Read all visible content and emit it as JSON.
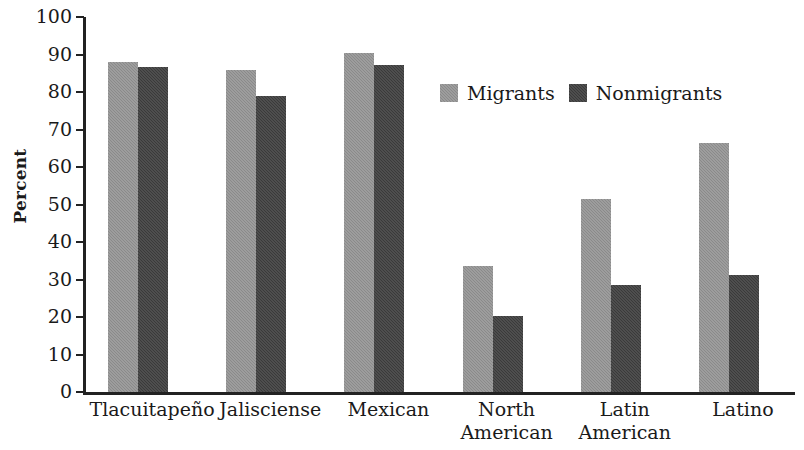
{
  "chart_data": {
    "type": "bar",
    "title": "",
    "xlabel": "",
    "ylabel": "Percent",
    "ylim": [
      0,
      100
    ],
    "ytick_step": 10,
    "yticks": [
      100,
      90,
      80,
      70,
      60,
      50,
      40,
      30,
      20,
      10,
      0
    ],
    "grid": false,
    "legend_position": "upper center",
    "categories": [
      "Tlacuitapeño",
      "Jalisciense",
      "Mexican",
      "North American",
      "Latin American",
      "Latino"
    ],
    "category_lines": [
      [
        "Tlacuitapeño"
      ],
      [
        "Jalisciense"
      ],
      [
        "Mexican"
      ],
      [
        "North",
        "American"
      ],
      [
        "Latin",
        "American"
      ],
      [
        "Latino"
      ]
    ],
    "series": [
      {
        "name": "Migrants",
        "color": "#8a8a8a",
        "values": [
          88.0,
          86.0,
          90.3,
          33.6,
          51.4,
          66.4
        ]
      },
      {
        "name": "Nonmigrants",
        "color": "#3a3a3a",
        "values": [
          86.8,
          78.9,
          87.1,
          20.2,
          28.5,
          31.3
        ]
      }
    ]
  },
  "legend": {
    "items": [
      {
        "label": "Migrants",
        "swatch": "migrants"
      },
      {
        "label": "Nonmigrants",
        "swatch": "nonmigrants"
      }
    ]
  }
}
